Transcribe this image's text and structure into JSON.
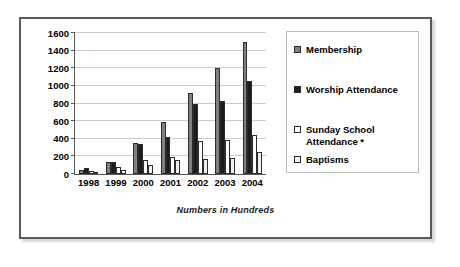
{
  "frame": {
    "border_color": "#5a5a5a",
    "background": "#ffffff"
  },
  "caption": "Numbers in Hundreds",
  "legend": {
    "position": "right",
    "items": [
      {
        "label": "Membership",
        "color": "#808080"
      },
      {
        "label": "Worship Attendance",
        "color": "#1c1c1c"
      },
      {
        "label": "Sunday School Attendance *",
        "color": "#fdfdfd"
      },
      {
        "label": "Baptisms",
        "color": "#f0f0f0"
      }
    ]
  },
  "chart_data": {
    "type": "bar",
    "title": "",
    "subtitle": "",
    "xlabel": "",
    "ylabel": "",
    "annotations": [
      "Numbers in Hundreds"
    ],
    "categories": [
      "1998",
      "1999",
      "2000",
      "2001",
      "2002",
      "2003",
      "2004"
    ],
    "ylim": [
      0,
      1600
    ],
    "yticks": [
      0,
      200,
      400,
      600,
      800,
      1000,
      1200,
      1400,
      1600
    ],
    "grid": true,
    "legend_position": "right",
    "series": [
      {
        "name": "Membership",
        "color": "#808080",
        "values": [
          45,
          140,
          350,
          595,
          920,
          1200,
          1500
        ]
      },
      {
        "name": "Worship Attendance",
        "color": "#1c1c1c",
        "values": [
          65,
          135,
          345,
          425,
          800,
          830,
          1050
        ]
      },
      {
        "name": "Sunday School Attendance *",
        "color": "#fdfdfd",
        "values": [
          30,
          80,
          155,
          195,
          375,
          390,
          440
        ]
      },
      {
        "name": "Baptisms",
        "color": "#f0f0f0",
        "values": [
          10,
          50,
          105,
          160,
          165,
          185,
          245
        ]
      }
    ]
  }
}
